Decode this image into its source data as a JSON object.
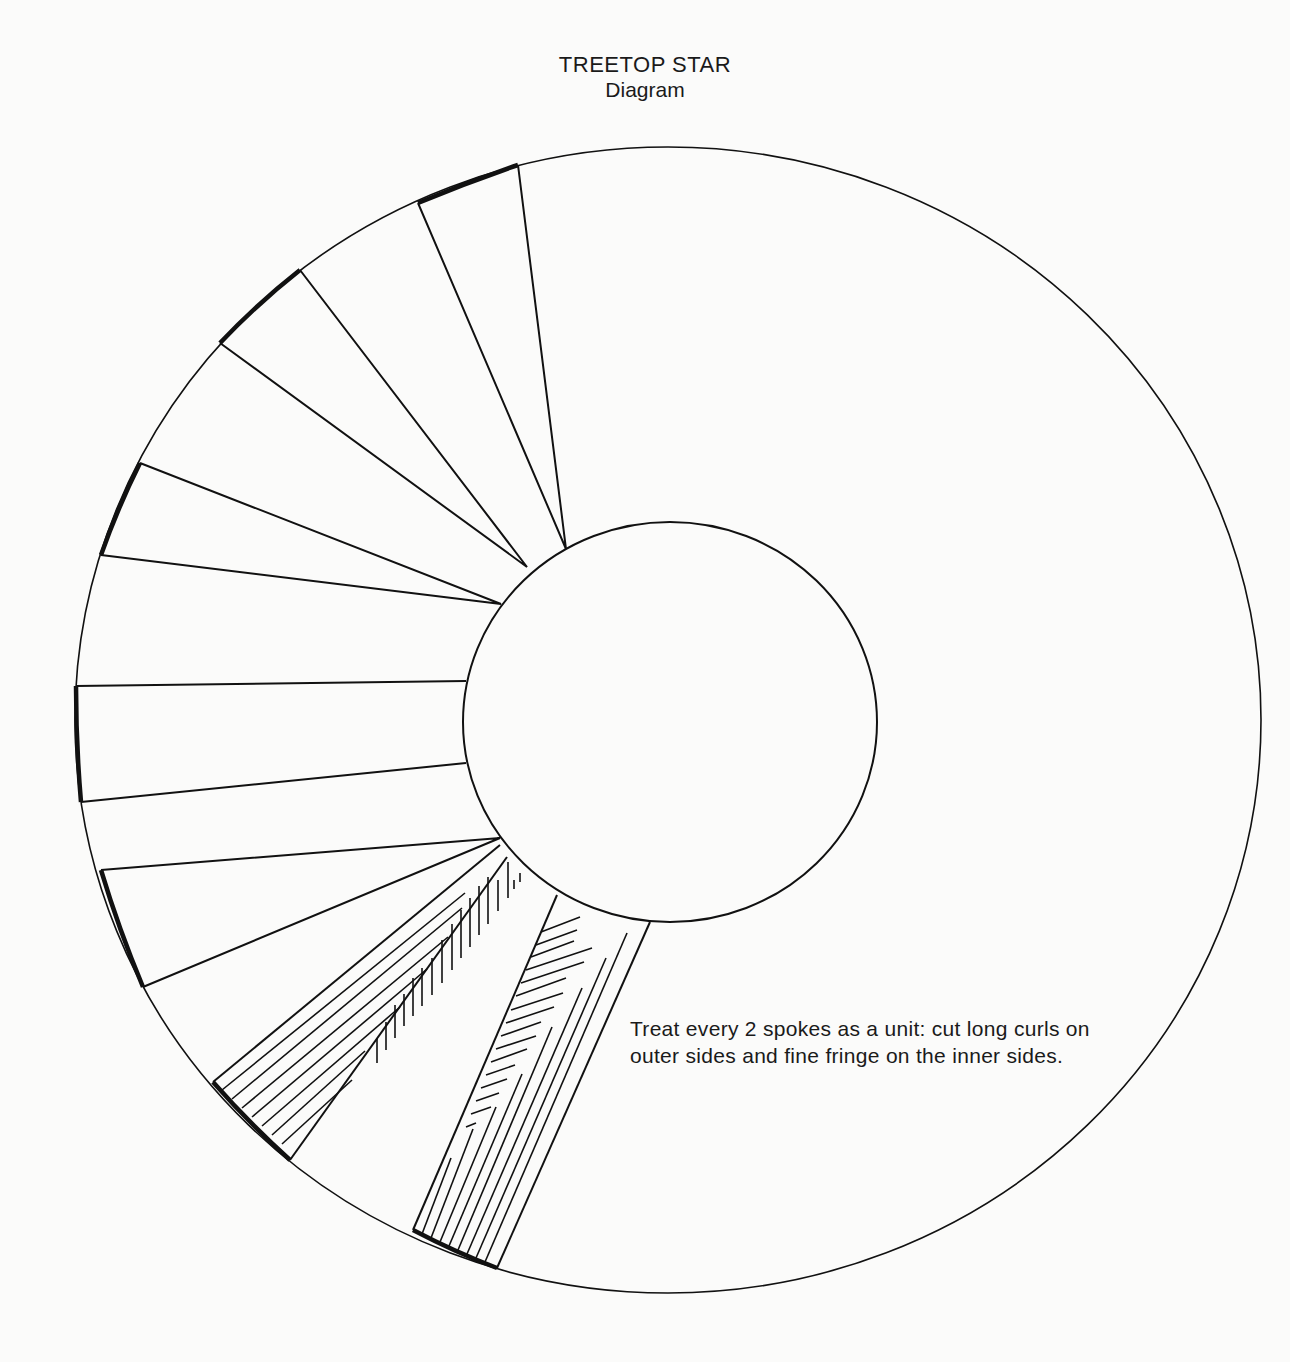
{
  "title": "TREETOP STAR",
  "subtitle": "Diagram",
  "instruction": "Treat every 2 spokes as a unit: cut long curls on outer sides and fine fringe on the inner sides.",
  "diagram": {
    "outer_circle": {
      "cx": 668,
      "cy": 720,
      "rx": 593,
      "ry": 573
    },
    "inner_circle": {
      "cx": 670,
      "cy": 722,
      "rx": 207,
      "ry": 200
    },
    "spoke_count": 7,
    "hatched_spokes": 2,
    "line_color": "#111111",
    "background": "#fbfbfa"
  }
}
